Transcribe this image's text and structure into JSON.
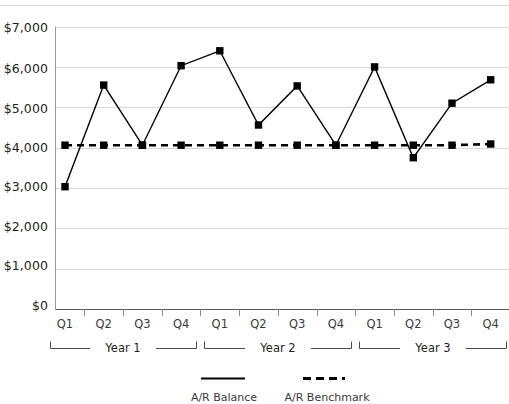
{
  "chart_data": {
    "type": "line",
    "title": "",
    "subtitle": "",
    "xlabel": "",
    "ylabel": "",
    "categories": [
      "Q1",
      "Q2",
      "Q3",
      "Q4",
      "Q1",
      "Q2",
      "Q3",
      "Q4",
      "Q1",
      "Q2",
      "Q3",
      "Q4"
    ],
    "group_labels": [
      "Year 1",
      "Year 2",
      "Year 3"
    ],
    "group_spans": [
      4,
      4,
      4
    ],
    "series": [
      {
        "name": "A/R Balance",
        "style": "solid",
        "marker": "square",
        "color": "#000000",
        "values": [
          3030,
          5550,
          4060,
          6030,
          6400,
          4560,
          5530,
          4060,
          6000,
          3750,
          5100,
          5680
        ]
      },
      {
        "name": "A/R Benchmark",
        "style": "dashed",
        "marker": "square",
        "color": "#000000",
        "values": [
          4060,
          4060,
          4060,
          4060,
          4060,
          4060,
          4060,
          4060,
          4060,
          4060,
          4060,
          4090
        ]
      }
    ],
    "ylim": [
      0,
      7000
    ],
    "yticks": [
      0,
      1000,
      2000,
      3000,
      4000,
      5000,
      6000,
      7000
    ],
    "ytick_labels": [
      "$0",
      "$1,000",
      "$2,000",
      "$3,000",
      "$4,000",
      "$5,000",
      "$6,000",
      "$7,000"
    ],
    "grid": true,
    "grid_color": "#d9d9d9",
    "legend_position": "bottom",
    "legend": [
      "A/R Balance",
      "A/R Benchmark"
    ]
  },
  "axis": {
    "ytick_labels": [
      "$7,000",
      "$6,000",
      "$5,000",
      "$4,000",
      "$3,000",
      "$2,000",
      "$1,000",
      "$0"
    ],
    "quarter_labels": [
      "Q1",
      "Q2",
      "Q3",
      "Q4",
      "Q1",
      "Q2",
      "Q3",
      "Q4",
      "Q1",
      "Q2",
      "Q3",
      "Q4"
    ],
    "year_labels": [
      "Year 1",
      "Year 2",
      "Year 3"
    ]
  },
  "legend": {
    "items": [
      {
        "label": "A/R Balance",
        "style": "solid"
      },
      {
        "label": "A/R Benchmark",
        "style": "dashed"
      }
    ]
  }
}
